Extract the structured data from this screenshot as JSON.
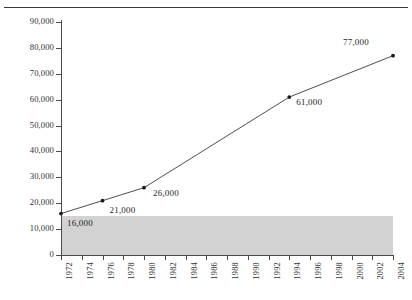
{
  "chart_data": {
    "type": "line",
    "title": "",
    "xlabel": "",
    "ylabel": "",
    "xlim": [
      1972,
      2004
    ],
    "ylim": [
      0,
      90000
    ],
    "grid": false,
    "legend": null,
    "x_tick_labels": [
      "1972",
      "1974",
      "1976",
      "1978",
      "1980",
      "1982",
      "1984",
      "1986",
      "1988",
      "1990",
      "1992",
      "1994",
      "1996",
      "1998",
      "2000",
      "2002",
      "2004"
    ],
    "y_tick_labels": [
      "0",
      "10,000",
      "20,000",
      "30,000",
      "40,000",
      "50,000",
      "60,000",
      "70,000",
      "80,000",
      "90,000"
    ],
    "y_tick_values": [
      0,
      10000,
      20000,
      30000,
      40000,
      50000,
      60000,
      70000,
      80000,
      90000
    ],
    "series": [
      {
        "name": "",
        "x": [
          1972,
          1976,
          1980,
          1994,
          2004
        ],
        "values": [
          16000,
          21000,
          26000,
          61000,
          77000
        ],
        "point_labels": [
          "16,000",
          "21,000",
          "26,000",
          "61,000",
          "77,000"
        ],
        "marker": "dot",
        "line_color": "#3a3a3a",
        "marker_color": "#1a1a1a"
      }
    ],
    "shaded_region": {
      "from": 0,
      "to": 15000,
      "color": "#d2d2d2",
      "label": ""
    }
  }
}
